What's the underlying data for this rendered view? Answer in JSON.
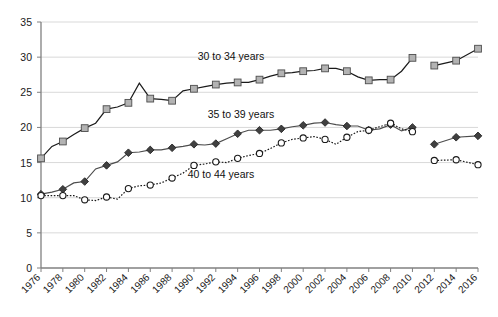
{
  "chart_data": {
    "type": "line",
    "title": "",
    "subtitle": "",
    "xlabel": "",
    "ylabel": "",
    "xlim": [
      1976,
      2016
    ],
    "ylim": [
      0,
      35
    ],
    "ytick_step": 5,
    "xtick_step": 2,
    "grid": true,
    "legend_position": "inline-annotations",
    "x": [
      1976,
      1977,
      1978,
      1979,
      1980,
      1981,
      1982,
      1983,
      1984,
      1985,
      1986,
      1987,
      1988,
      1989,
      1990,
      1991,
      1992,
      1993,
      1994,
      1995,
      1996,
      1997,
      1998,
      1999,
      2000,
      2001,
      2002,
      2003,
      2004,
      2005,
      2006,
      2007,
      2008,
      2009,
      2010,
      2012,
      2014,
      2016
    ],
    "xtick_labels": [
      "1976",
      "1978",
      "1980",
      "1982",
      "1984",
      "1986",
      "1988",
      "1990",
      "1992",
      "1994",
      "1996",
      "1998",
      "2000",
      "2002",
      "2004",
      "2006",
      "2008",
      "2010",
      "2012",
      "2014",
      "2016"
    ],
    "ytick_labels": [
      "0",
      "5",
      "10",
      "15",
      "20",
      "25",
      "30",
      "35"
    ],
    "series_break_after": 2010,
    "series": [
      {
        "name": "30 to 34 years",
        "marker": "square",
        "marker_fill": "#b3b3b3",
        "line_color": "#1a1a1a",
        "line_style": "solid",
        "annotation_label": "30 to 34 years",
        "values": [
          15.6,
          17.3,
          18.0,
          19.0,
          19.9,
          20.6,
          22.6,
          22.9,
          23.5,
          26.3,
          24.1,
          24.0,
          23.8,
          25.2,
          25.5,
          25.8,
          26.1,
          26.3,
          26.4,
          26.4,
          26.8,
          27.3,
          27.7,
          27.8,
          28.0,
          28.1,
          28.4,
          28.4,
          28.0,
          27.2,
          26.7,
          26.8,
          26.8,
          28.0,
          29.9,
          28.8,
          29.5,
          31.2
        ]
      },
      {
        "name": "35 to 39 years",
        "marker": "diamond",
        "marker_fill": "#404040",
        "line_color": "#4d4d4d",
        "line_style": "solid",
        "annotation_label": "35 to 39 years",
        "values": [
          10.5,
          10.8,
          11.2,
          12.1,
          12.3,
          14.1,
          14.6,
          15.1,
          16.4,
          16.5,
          16.8,
          16.8,
          17.1,
          17.3,
          17.6,
          17.5,
          17.7,
          18.4,
          19.1,
          19.6,
          19.6,
          19.6,
          19.8,
          20.1,
          20.3,
          20.6,
          20.7,
          20.4,
          20.2,
          20.2,
          19.6,
          19.8,
          20.4,
          19.5,
          20.0,
          17.6,
          18.6,
          18.8
        ]
      },
      {
        "name": "40 to 44 years",
        "marker": "circle-open",
        "marker_fill": "#ffffff",
        "line_color": "#1a1a1a",
        "line_style": "dotted",
        "annotation_label": "40 to 44 years",
        "values": [
          10.3,
          10.3,
          10.3,
          10.3,
          9.7,
          9.6,
          10.1,
          9.8,
          11.3,
          11.7,
          11.8,
          12.1,
          12.8,
          13.5,
          14.6,
          14.8,
          15.1,
          15.0,
          15.6,
          16.0,
          16.3,
          17.0,
          17.8,
          18.3,
          18.5,
          18.7,
          18.3,
          17.6,
          18.6,
          19.4,
          19.6,
          20.1,
          20.6,
          19.8,
          19.4,
          15.3,
          15.4,
          14.7
        ]
      }
    ],
    "annotations": [
      {
        "text": "30 to 34 years",
        "x_px": 231,
        "y_px": 60
      },
      {
        "text": "35 to 39 years",
        "x_px": 241,
        "y_px": 118
      },
      {
        "text": "40 to 44 years",
        "x_px": 221,
        "y_px": 178
      }
    ]
  }
}
